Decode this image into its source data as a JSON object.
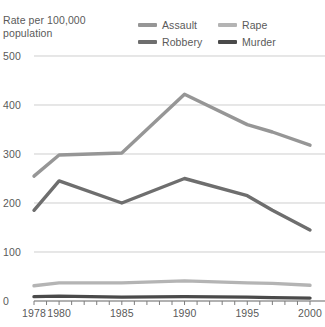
{
  "chart_data": {
    "type": "line",
    "title": "Rate per 100,000\npopulation",
    "xlabel": "",
    "ylabel": "Rate per 100,000 population",
    "x": [
      1978,
      1980,
      1985,
      1990,
      1995,
      1997,
      2000
    ],
    "xlim": [
      1978,
      2000
    ],
    "ylim": [
      0,
      500
    ],
    "yticks": [
      0,
      100,
      200,
      300,
      400,
      500
    ],
    "ytick_labels": [
      "0",
      "100",
      "200",
      "300",
      "400",
      "500"
    ],
    "xticks": [
      1978,
      1980,
      1985,
      1990,
      1995,
      2000
    ],
    "xtick_labels": [
      "1978",
      "1980",
      "1985",
      "1990",
      "1995",
      "2000"
    ],
    "xtick_minor": [
      1979,
      1981,
      1982,
      1983,
      1984,
      1986,
      1987,
      1988,
      1989,
      1991,
      1992,
      1993,
      1994,
      1996,
      1997,
      1998,
      1999
    ],
    "grid": "horizontal",
    "legend_position": "top-right",
    "series": [
      {
        "name": "Assault",
        "color": "#969696",
        "values": [
          255,
          298,
          302,
          422,
          360,
          345,
          318
        ]
      },
      {
        "name": "Robbery",
        "color": "#6e6e6e",
        "values": [
          185,
          245,
          200,
          250,
          215,
          185,
          145
        ]
      },
      {
        "name": "Rape",
        "color": "#b4b4b4",
        "values": [
          31,
          37,
          37,
          41,
          37,
          36,
          32
        ]
      },
      {
        "name": "Murder",
        "color": "#4a4a4a",
        "values": [
          9,
          10,
          8,
          9,
          8,
          7,
          6
        ]
      }
    ]
  },
  "legend": {
    "items": [
      {
        "label": "Assault",
        "color": "#969696"
      },
      {
        "label": "Rape",
        "color": "#b4b4b4"
      },
      {
        "label": "Robbery",
        "color": "#6e6e6e"
      },
      {
        "label": "Murder",
        "color": "#4a4a4a"
      }
    ]
  }
}
